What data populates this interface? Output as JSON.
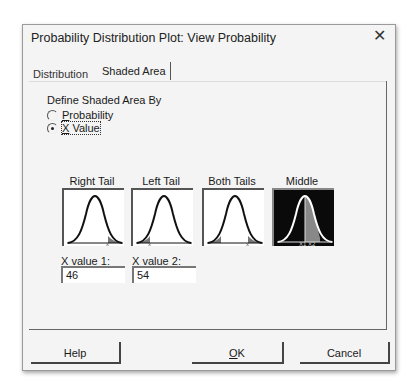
{
  "window": {
    "title": "Probability Distribution Plot: View Probability",
    "close_glyph": "✕"
  },
  "tabs": [
    {
      "label": "Distribution",
      "active": false
    },
    {
      "label": "Shaded Area",
      "active": true
    }
  ],
  "define_group": {
    "label": "Define Shaded Area By",
    "options": [
      {
        "mnemonic": "P",
        "rest": "robability",
        "selected": false
      },
      {
        "mnemonic": "X",
        "rest": " Value",
        "selected": true
      }
    ]
  },
  "area_options": [
    {
      "label": "Right Tail",
      "selected": false,
      "marker": "x"
    },
    {
      "label": "Left Tail",
      "selected": false,
      "marker": "x"
    },
    {
      "label": "Both Tails",
      "selected": false,
      "marker": "x"
    },
    {
      "label": "Middle",
      "selected": true,
      "marker": "X1 X2"
    }
  ],
  "fields": [
    {
      "label_pre": "X ",
      "label_mn": "v",
      "label_post": "alue 1:",
      "value": "46"
    },
    {
      "label_pre": "X v",
      "label_mn": "a",
      "label_post": "lue 2:",
      "value": "54"
    }
  ],
  "buttons": {
    "help": "Help",
    "ok_mn": "O",
    "ok_rest": "K",
    "cancel": "Cancel"
  },
  "colors": {
    "dialog_bg": "#f4f4f4",
    "selected_tile": "#0a0a0a",
    "shade": "#888888"
  }
}
